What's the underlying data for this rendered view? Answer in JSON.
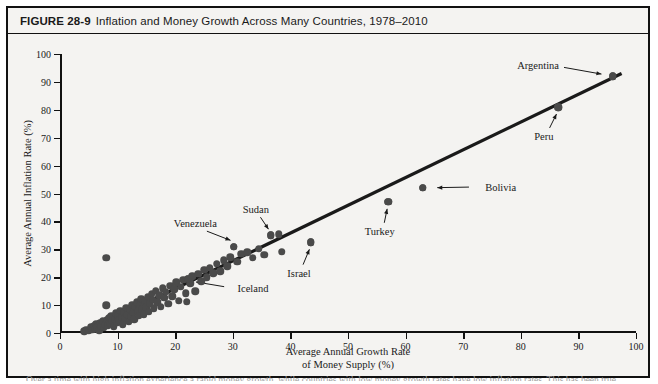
{
  "figure": {
    "number": "FIGURE 28-9",
    "title": "Inflation and Money Growth Across Many Countries, 1978–2010",
    "caption_partial": "Over a time with high inflation experience a rapid money growth, while countries with low money growth rates have low inflation rates. This has been true"
  },
  "chart_data": {
    "type": "scatter",
    "title": "Inflation and Money Growth Across Many Countries, 1978–2010",
    "xlabel": "Average Annual Growth Rate of Money Supply (%)",
    "ylabel": "Average Annual Inflation Rate (%)",
    "xlabel_line1": "Average Annual Growth Rate",
    "xlabel_line2": "of Money Supply (%)",
    "xlim": [
      0,
      100
    ],
    "ylim": [
      0,
      100
    ],
    "xticks": [
      0,
      10,
      20,
      30,
      40,
      50,
      60,
      70,
      80,
      90,
      100
    ],
    "yticks": [
      0,
      10,
      20,
      30,
      40,
      50,
      60,
      70,
      80,
      90,
      100
    ],
    "grid": false,
    "legend": "none",
    "marker_color": "#4a4a4a",
    "line_color": "#1a1a1a",
    "trendline": {
      "x0": 4,
      "y0": 0,
      "x1": 97.5,
      "y1": 93
    },
    "points": [
      [
        4.2,
        0.6
      ],
      [
        4.6,
        1.2
      ],
      [
        5.0,
        0.8
      ],
      [
        5.3,
        2.0
      ],
      [
        5.6,
        1.1
      ],
      [
        5.9,
        2.6
      ],
      [
        6.1,
        1.5
      ],
      [
        6.3,
        3.2
      ],
      [
        6.5,
        2.1
      ],
      [
        6.8,
        1.0
      ],
      [
        7.0,
        3.6
      ],
      [
        7.2,
        2.4
      ],
      [
        7.4,
        4.2
      ],
      [
        7.6,
        1.8
      ],
      [
        7.8,
        3.0
      ],
      [
        8.0,
        27.0
      ],
      [
        8.0,
        10.0
      ],
      [
        8.1,
        4.8
      ],
      [
        8.3,
        2.8
      ],
      [
        8.5,
        5.4
      ],
      [
        8.7,
        3.4
      ],
      [
        8.9,
        6.0
      ],
      [
        9.1,
        4.4
      ],
      [
        9.3,
        2.2
      ],
      [
        9.5,
        5.0
      ],
      [
        9.7,
        7.0
      ],
      [
        9.9,
        3.8
      ],
      [
        10.1,
        6.4
      ],
      [
        10.3,
        4.6
      ],
      [
        10.5,
        8.0
      ],
      [
        10.7,
        5.6
      ],
      [
        10.9,
        3.2
      ],
      [
        11.1,
        7.4
      ],
      [
        11.3,
        5.2
      ],
      [
        11.5,
        9.0
      ],
      [
        11.7,
        6.6
      ],
      [
        11.9,
        4.0
      ],
      [
        12.1,
        8.4
      ],
      [
        12.3,
        6.0
      ],
      [
        12.5,
        10.2
      ],
      [
        12.7,
        7.2
      ],
      [
        12.9,
        5.0
      ],
      [
        13.1,
        9.4
      ],
      [
        13.3,
        11.0
      ],
      [
        13.5,
        7.8
      ],
      [
        13.7,
        6.2
      ],
      [
        13.9,
        10.0
      ],
      [
        14.1,
        12.2
      ],
      [
        14.3,
        8.6
      ],
      [
        14.5,
        6.8
      ],
      [
        14.8,
        11.4
      ],
      [
        15.0,
        9.2
      ],
      [
        15.2,
        13.0
      ],
      [
        15.4,
        7.6
      ],
      [
        15.6,
        10.6
      ],
      [
        15.9,
        14.0
      ],
      [
        16.1,
        12.0
      ],
      [
        16.3,
        8.8
      ],
      [
        16.6,
        15.2
      ],
      [
        16.9,
        11.0
      ],
      [
        17.2,
        13.6
      ],
      [
        17.5,
        9.4
      ],
      [
        17.8,
        16.0
      ],
      [
        18.1,
        12.6
      ],
      [
        18.4,
        14.8
      ],
      [
        18.8,
        10.4
      ],
      [
        19.1,
        17.0
      ],
      [
        19.5,
        13.2
      ],
      [
        19.8,
        15.6
      ],
      [
        20.2,
        18.2
      ],
      [
        20.6,
        11.6
      ],
      [
        21.0,
        16.6
      ],
      [
        21.4,
        19.0
      ],
      [
        21.8,
        14.2
      ],
      [
        22.2,
        19.4
      ],
      [
        22.0,
        11.2
      ],
      [
        22.6,
        17.8
      ],
      [
        23.0,
        20.4
      ],
      [
        23.5,
        15.0
      ],
      [
        24.0,
        21.2
      ],
      [
        24.5,
        18.6
      ],
      [
        25.0,
        22.6
      ],
      [
        25.5,
        20.0
      ],
      [
        26.0,
        23.4
      ],
      [
        26.6,
        21.4
      ],
      [
        27.2,
        24.8
      ],
      [
        27.8,
        22.2
      ],
      [
        28.4,
        26.0
      ],
      [
        29.0,
        24.0
      ],
      [
        29.6,
        27.2
      ],
      [
        30.2,
        31.0
      ],
      [
        30.8,
        25.6
      ],
      [
        31.5,
        28.4
      ],
      [
        32.5,
        29.0
      ],
      [
        33.5,
        27.0
      ],
      [
        34.5,
        30.2
      ],
      [
        35.5,
        28.0
      ],
      [
        36.6,
        35.0
      ],
      [
        38.0,
        35.4
      ],
      [
        38.5,
        29.2
      ],
      [
        43.5,
        32.6
      ],
      [
        57.0,
        47.0
      ],
      [
        63.0,
        52.0
      ],
      [
        86.5,
        81.0
      ],
      [
        96.0,
        92.0
      ]
    ],
    "annotations": [
      {
        "name": "Argentina",
        "x": 96.0,
        "y": 92.0,
        "label_x": 83.0,
        "label_y": 96.0,
        "line": {
          "x1": 87.5,
          "y1": 95.2,
          "x2": 94.0,
          "y2": 92.8
        }
      },
      {
        "name": "Peru",
        "x": 86.5,
        "y": 81.0,
        "label_x": 84.0,
        "label_y": 70.5,
        "line": {
          "x1": 85.0,
          "y1": 73.5,
          "x2": 86.2,
          "y2": 78.5
        }
      },
      {
        "name": "Bolivia",
        "x": 63.0,
        "y": 52.0,
        "label_x": 76.5,
        "label_y": 52.5,
        "line": {
          "x1": 71.0,
          "y1": 52.3,
          "x2": 65.5,
          "y2": 52.1
        }
      },
      {
        "name": "Turkey",
        "x": 57.0,
        "y": 47.0,
        "label_x": 55.5,
        "label_y": 36.5,
        "line": {
          "x1": 56.3,
          "y1": 39.5,
          "x2": 56.8,
          "y2": 44.5
        }
      },
      {
        "name": "Israel",
        "x": 43.5,
        "y": 32.6,
        "label_x": 41.5,
        "label_y": 21.5,
        "line": {
          "x1": 42.2,
          "y1": 24.5,
          "x2": 43.3,
          "y2": 30.0
        }
      },
      {
        "name": "Sudan",
        "x": 36.6,
        "y": 35.0,
        "label_x": 34.0,
        "label_y": 44.5,
        "line": {
          "x1": 34.8,
          "y1": 41.5,
          "x2": 36.2,
          "y2": 37.2
        }
      },
      {
        "name": "Venezuela",
        "x": 30.2,
        "y": 31.0,
        "label_x": 23.5,
        "label_y": 39.5,
        "line": {
          "x1": 25.5,
          "y1": 36.5,
          "x2": 29.6,
          "y2": 33.2
        }
      },
      {
        "name": "Iceland",
        "x": 22.2,
        "y": 19.4,
        "label_x": 33.5,
        "label_y": 16.0,
        "line": {
          "x1": 28.5,
          "y1": 16.6,
          "x2": 23.6,
          "y2": 18.3
        }
      }
    ]
  }
}
